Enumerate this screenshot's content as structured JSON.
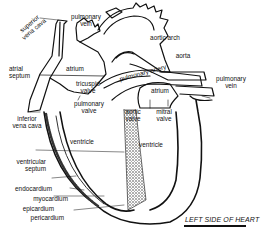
{
  "diagram": {
    "title": "LEFT SIDE OF HEART",
    "labels": {
      "superior_vena_cava": "superior\nvena cava",
      "pulmonary_vein_top": "pulmonary\nvein",
      "aortic_arch": "aortic arch",
      "aorta": "aorta",
      "pulmonary_artery": "pulmonary artery",
      "pulmonary_vein_right": "pulmonary\nvein",
      "atrial_septum": "atrial\nseptum",
      "atrium_right": "atrium",
      "atrium_left": "atrium",
      "tricuspid_valve": "tricuspid\nvalve",
      "pulmonary_valve": "pulmonary\nvalve",
      "aortic_valve": "aortic\nvalve",
      "mitral_valve": "mitral\nvalve",
      "inferior_vena_cava": "inferior\nvena cava",
      "ventricle_right": "ventricle",
      "ventricle_left": "ventricle",
      "ventricular_septum": "ventricular\nseptum",
      "endocardium": "endocardium",
      "myocardium": "myocardium",
      "epicardium": "epicardium",
      "pericardium": "pericardium"
    },
    "colors": {
      "ink": "#111111",
      "background": "#ffffff"
    }
  }
}
